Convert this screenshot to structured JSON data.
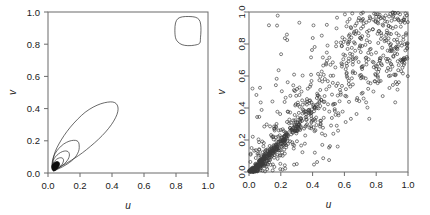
{
  "figure": {
    "title": "",
    "background_color": "#ffffff",
    "panel_count": 2,
    "width": 430,
    "height": 215
  },
  "chart_data": [
    {
      "type": "line",
      "subtype": "contour",
      "panel": "left",
      "title": "",
      "xlabel": "u",
      "ylabel": "v",
      "xlim": [
        0.0,
        1.0
      ],
      "ylim": [
        0.0,
        1.0
      ],
      "xticks": [
        0.0,
        0.2,
        0.4,
        0.6,
        0.8,
        1.0
      ],
      "yticks": [
        0.0,
        0.2,
        0.4,
        0.6,
        0.8,
        1.0
      ],
      "xticklabels": [
        "0.0",
        "0.2",
        "0.4",
        "0.6",
        "0.8",
        "1.0"
      ],
      "yticklabels": [
        "0.0",
        "0.2",
        "0.4",
        "0.6",
        "0.8",
        "1.0"
      ],
      "grid": false,
      "legend": "none",
      "frame": true,
      "line_color": "#2a2a2a",
      "description": "Contour plot of a copula density; nested elongated contours along the lower-left diagonal plus one rounded-square contour in the upper-right corner.",
      "contours": [
        {
          "name": "outer-elongated-contour",
          "closed": true,
          "points": [
            [
              0.043,
              0.018
            ],
            [
              0.033,
              0.035
            ],
            [
              0.03,
              0.06
            ],
            [
              0.034,
              0.095
            ],
            [
              0.046,
              0.135
            ],
            [
              0.068,
              0.18
            ],
            [
              0.1,
              0.232
            ],
            [
              0.14,
              0.285
            ],
            [
              0.185,
              0.334
            ],
            [
              0.232,
              0.377
            ],
            [
              0.282,
              0.409
            ],
            [
              0.33,
              0.43
            ],
            [
              0.372,
              0.44
            ],
            [
              0.405,
              0.441
            ],
            [
              0.426,
              0.431
            ],
            [
              0.437,
              0.41
            ],
            [
              0.436,
              0.38
            ],
            [
              0.422,
              0.343
            ],
            [
              0.396,
              0.3
            ],
            [
              0.36,
              0.255
            ],
            [
              0.316,
              0.21
            ],
            [
              0.266,
              0.166
            ],
            [
              0.216,
              0.126
            ],
            [
              0.168,
              0.093
            ],
            [
              0.124,
              0.066
            ],
            [
              0.09,
              0.046
            ],
            [
              0.064,
              0.03
            ]
          ]
        },
        {
          "name": "second-contour",
          "closed": true,
          "points": [
            [
              0.04,
              0.016
            ],
            [
              0.029,
              0.034
            ],
            [
              0.026,
              0.059
            ],
            [
              0.031,
              0.09
            ],
            [
              0.045,
              0.122
            ],
            [
              0.068,
              0.153
            ],
            [
              0.098,
              0.18
            ],
            [
              0.131,
              0.197
            ],
            [
              0.16,
              0.203
            ],
            [
              0.181,
              0.2
            ],
            [
              0.192,
              0.188
            ],
            [
              0.195,
              0.168
            ],
            [
              0.194,
              0.146
            ],
            [
              0.186,
              0.123
            ],
            [
              0.17,
              0.098
            ],
            [
              0.147,
              0.075
            ],
            [
              0.119,
              0.055
            ],
            [
              0.09,
              0.038
            ],
            [
              0.063,
              0.025
            ]
          ]
        },
        {
          "name": "third-contour",
          "closed": true,
          "points": [
            [
              0.038,
              0.015
            ],
            [
              0.028,
              0.031
            ],
            [
              0.026,
              0.053
            ],
            [
              0.032,
              0.077
            ],
            [
              0.046,
              0.1
            ],
            [
              0.067,
              0.12
            ],
            [
              0.09,
              0.133
            ],
            [
              0.111,
              0.137
            ],
            [
              0.126,
              0.132
            ],
            [
              0.133,
              0.12
            ],
            [
              0.133,
              0.104
            ],
            [
              0.126,
              0.086
            ],
            [
              0.112,
              0.067
            ],
            [
              0.093,
              0.05
            ],
            [
              0.071,
              0.035
            ],
            [
              0.053,
              0.024
            ]
          ]
        },
        {
          "name": "fourth-contour",
          "closed": true,
          "points": [
            [
              0.036,
              0.014
            ],
            [
              0.028,
              0.027
            ],
            [
              0.027,
              0.044
            ],
            [
              0.033,
              0.062
            ],
            [
              0.046,
              0.079
            ],
            [
              0.063,
              0.091
            ],
            [
              0.08,
              0.095
            ],
            [
              0.092,
              0.091
            ],
            [
              0.097,
              0.081
            ],
            [
              0.095,
              0.068
            ],
            [
              0.087,
              0.053
            ],
            [
              0.073,
              0.038
            ],
            [
              0.057,
              0.026
            ],
            [
              0.045,
              0.019
            ]
          ]
        },
        {
          "name": "inner-dark-core",
          "closed": true,
          "filled": true,
          "points": [
            [
              0.034,
              0.012
            ],
            [
              0.026,
              0.022
            ],
            [
              0.023,
              0.036
            ],
            [
              0.026,
              0.05
            ],
            [
              0.036,
              0.062
            ],
            [
              0.05,
              0.07
            ],
            [
              0.063,
              0.07
            ],
            [
              0.071,
              0.063
            ],
            [
              0.072,
              0.051
            ],
            [
              0.066,
              0.038
            ],
            [
              0.055,
              0.025
            ],
            [
              0.044,
              0.016
            ]
          ]
        },
        {
          "name": "upper-right-corner-contour",
          "closed": true,
          "points": [
            [
              0.797,
              0.84
            ],
            [
              0.793,
              0.887
            ],
            [
              0.797,
              0.932
            ],
            [
              0.812,
              0.959
            ],
            [
              0.84,
              0.97
            ],
            [
              0.88,
              0.972
            ],
            [
              0.92,
              0.968
            ],
            [
              0.944,
              0.953
            ],
            [
              0.954,
              0.925
            ],
            [
              0.956,
              0.884
            ],
            [
              0.953,
              0.84
            ],
            [
              0.948,
              0.806
            ],
            [
              0.916,
              0.794
            ],
            [
              0.874,
              0.791
            ],
            [
              0.838,
              0.797
            ],
            [
              0.812,
              0.814
            ]
          ]
        }
      ]
    },
    {
      "type": "scatter",
      "panel": "right",
      "title": "",
      "xlabel": "u",
      "ylabel": "v",
      "xlim": [
        0.0,
        1.0
      ],
      "ylim": [
        0.0,
        1.0
      ],
      "xticks": [
        0.0,
        0.2,
        0.4,
        0.6,
        0.8,
        1.0
      ],
      "yticks": [
        0.0,
        0.2,
        0.4,
        0.6,
        0.8,
        1.0
      ],
      "xticklabels": [
        "0.0",
        "0.2",
        "0.4",
        "0.6",
        "0.8",
        "1.0"
      ],
      "yticklabels": [
        "0.0",
        "0.2",
        "0.4",
        "0.6",
        "0.8",
        "1.0"
      ],
      "grid": false,
      "legend": "none",
      "frame": true,
      "marker": "open-circle",
      "marker_size": 3,
      "marker_color": "#3a3a3a",
      "n_points": 1000,
      "description": "Scatter of 1000 simulated copula samples on the unit square; strong positive dependence with a very dense dark wedge of points near the origin, a broad diffuse cloud toward the upper right, and a secondary concentration near (1,1).",
      "y_tick_label_rotation": -90
    }
  ],
  "panels": {
    "left": {
      "name": "contour-panel",
      "xlabel": "u",
      "ylabel": "v"
    },
    "right": {
      "name": "scatter-panel",
      "xlabel": "u",
      "ylabel": "v"
    }
  }
}
